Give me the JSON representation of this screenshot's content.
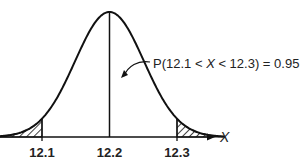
{
  "chart_data": {
    "type": "area",
    "title": "",
    "distribution": "normal",
    "mean": 12.2,
    "xlabel": "X",
    "ylabel": "",
    "xlim": [
      12.03,
      12.37
    ],
    "ticks": [
      {
        "value": 12.1,
        "label": "12.1"
      },
      {
        "value": 12.2,
        "label": "12.2"
      },
      {
        "value": 12.3,
        "label": "12.3"
      }
    ],
    "shaded_tails": [
      {
        "from": 12.03,
        "to": 12.1,
        "pattern": "hatched"
      },
      {
        "from": 12.3,
        "to": 12.37,
        "pattern": "hatched"
      }
    ],
    "center_line": 12.2,
    "annotation": {
      "text_prefix": "P(12.1 < ",
      "variable": "X",
      "text_suffix": " < 12.3) = 0.95",
      "probability": 0.95,
      "interval": [
        12.1,
        12.3
      ]
    },
    "grid": false
  },
  "colors": {
    "ink": "#111111",
    "background": "#ffffff"
  }
}
